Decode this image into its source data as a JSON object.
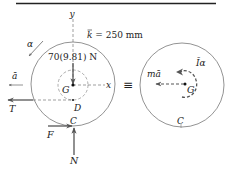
{
  "diagram": {
    "type": "free-body-diagram / kinetic-diagram",
    "fbd": {
      "axis_y_label": "y",
      "axis_x_label": "x",
      "radius_of_gyration_label": "k̄ = 250 mm",
      "weight_label": "70(9.81) N",
      "center_label": "G",
      "point_d_label": "D",
      "contact_point_label": "C",
      "angular_accel_label": "α",
      "linear_accel_label": "ā",
      "tension_label": "T",
      "friction_label": "F",
      "normal_label": "N"
    },
    "equivalence_symbol": "≡",
    "kd": {
      "inertia_force_label": "mā",
      "inertia_moment_label": "Īα",
      "center_label": "G",
      "contact_point_label": "C"
    },
    "colors": {
      "line": "#555555",
      "arrow": "#666666",
      "text": "#222222",
      "rule": "#222222"
    }
  }
}
